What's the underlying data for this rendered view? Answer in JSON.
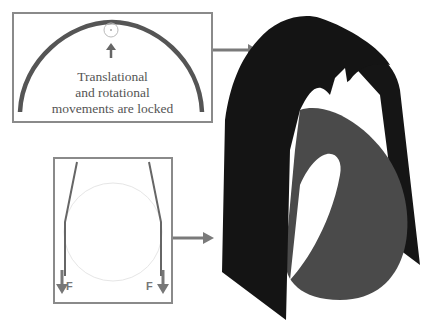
{
  "top_panel": {
    "caption_lines": [
      "Translational",
      "and rotational",
      "movements are locked"
    ],
    "arch_color": "#555555",
    "border_color": "#8a8a8a"
  },
  "bottom_panel": {
    "force_left_label": "F",
    "force_right_label": "F",
    "circle_color": "#e6e6e6"
  },
  "arrows": {
    "color": "#7a7a7a"
  },
  "model_3d": {
    "outer_band_color": "#141414",
    "inner_cylinder_color": "#4a4a4a"
  }
}
